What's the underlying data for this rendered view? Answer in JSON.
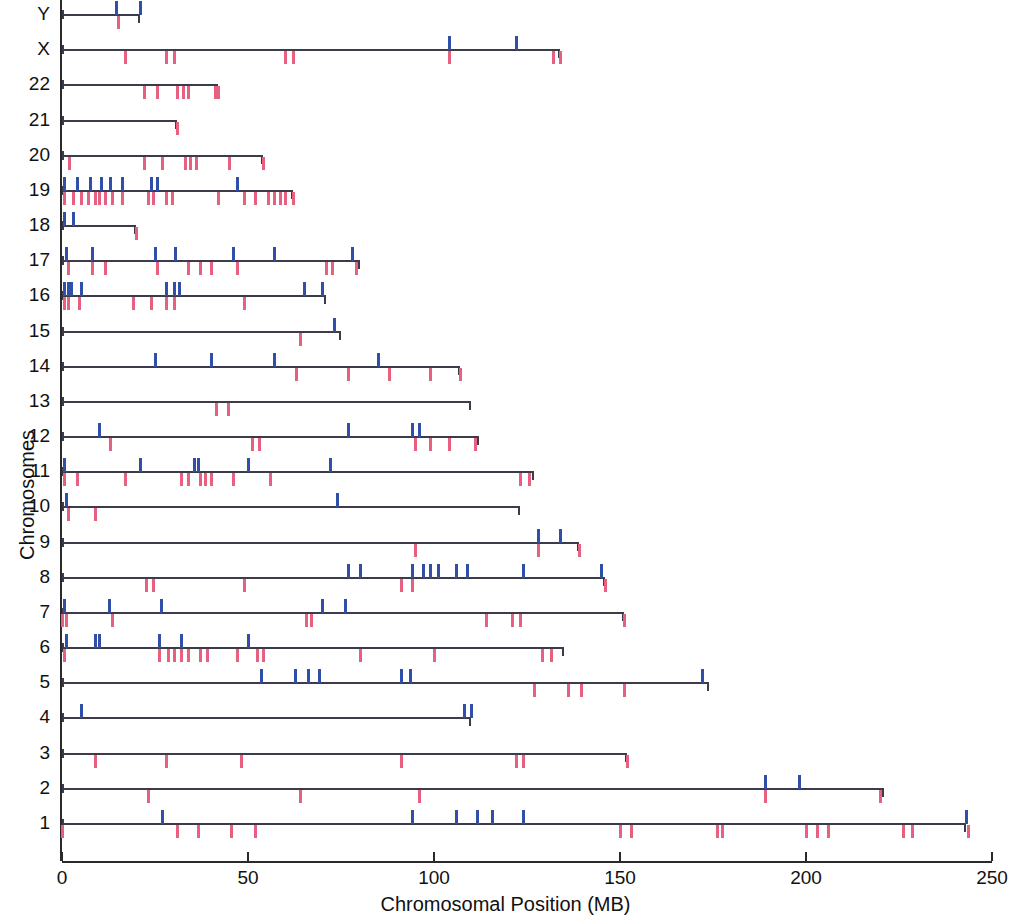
{
  "axes": {
    "x_title": "Chromosomal Position (MB)",
    "y_title": "Chromosomes",
    "x_ticks": [
      "0",
      "50",
      "100",
      "150",
      "200",
      "250"
    ],
    "x_min": 0,
    "x_max": 250
  },
  "colors": {
    "blue": "#2f4fa8",
    "red": "#e8607f",
    "line": "#3b3b4a",
    "axis": "#2a2a2a"
  },
  "chart_data": {
    "type": "scatter",
    "title": "",
    "xlabel": "Chromosomal Position (MB)",
    "ylabel": "Chromosomes",
    "xlim": [
      0,
      250
    ],
    "grid": false,
    "legend": null,
    "categories": [
      "1",
      "2",
      "3",
      "4",
      "5",
      "6",
      "7",
      "8",
      "9",
      "10",
      "11",
      "12",
      "13",
      "14",
      "15",
      "16",
      "17",
      "18",
      "19",
      "20",
      "21",
      "22",
      "X",
      "Y"
    ],
    "chromosomes": [
      {
        "name": "Y",
        "length": 21,
        "blue": [
          14.5,
          21.0
        ],
        "red": [
          15.0
        ]
      },
      {
        "name": "X",
        "length": 134,
        "blue": [
          104.0,
          122.0
        ],
        "red": [
          17.0,
          28.0,
          30.0,
          60.0,
          62.0,
          104.0,
          132.0,
          134.0
        ]
      },
      {
        "name": "22",
        "length": 42,
        "blue": [],
        "red": [
          22.0,
          25.5,
          31.0,
          32.5,
          34.0,
          41.0,
          42.0
        ]
      },
      {
        "name": "21",
        "length": 31,
        "blue": [],
        "red": [
          31.0
        ]
      },
      {
        "name": "20",
        "length": 54,
        "blue": [],
        "red": [
          2.0,
          22.0,
          27.0,
          33.0,
          34.5,
          36.0,
          45.0,
          54.0
        ]
      },
      {
        "name": "19",
        "length": 62,
        "blue": [
          0.5,
          4.0,
          7.5,
          10.5,
          13.0,
          16.0,
          24.0,
          25.5,
          47.0
        ],
        "red": [
          0.5,
          3.0,
          5.0,
          7.0,
          9.0,
          10.0,
          11.5,
          13.5,
          16.0,
          23.0,
          24.5,
          28.0,
          29.5,
          42.0,
          49.0,
          52.0,
          55.5,
          57.0,
          58.5,
          60.0,
          62.0
        ]
      },
      {
        "name": "18",
        "length": 20,
        "blue": [
          0.5,
          3.0
        ],
        "red": [
          20.0
        ]
      },
      {
        "name": "17",
        "length": 80,
        "blue": [
          1.0,
          8.0,
          25.0,
          30.5,
          46.0,
          57.0,
          78.0
        ],
        "red": [
          1.5,
          8.0,
          11.5,
          25.5,
          34.0,
          37.0,
          40.0,
          47.0,
          71.0,
          72.5,
          79.0
        ]
      },
      {
        "name": "16",
        "length": 71,
        "blue": [
          0.5,
          1.5,
          2.5,
          5.0,
          28.0,
          30.0,
          31.5,
          65.0,
          70.0
        ],
        "red": [
          0.5,
          1.5,
          4.5,
          19.0,
          24.0,
          28.0,
          30.0,
          49.0
        ]
      },
      {
        "name": "15",
        "length": 75,
        "blue": [
          73.0
        ],
        "red": [
          64.0
        ]
      },
      {
        "name": "14",
        "length": 107,
        "blue": [
          25.0,
          40.0,
          57.0,
          85.0
        ],
        "red": [
          63.0,
          77.0,
          88.0,
          99.0,
          107.0
        ]
      },
      {
        "name": "13",
        "length": 110,
        "blue": [],
        "red": [
          41.5,
          44.5
        ]
      },
      {
        "name": "12",
        "length": 112,
        "blue": [
          10.0,
          77.0,
          94.0,
          96.0
        ],
        "red": [
          13.0,
          51.0,
          53.0,
          95.0,
          99.0,
          104.0,
          111.0
        ]
      },
      {
        "name": "11",
        "length": 127,
        "blue": [
          0.5,
          21.0,
          35.5,
          36.5,
          50.0,
          72.0
        ],
        "red": [
          0.5,
          4.0,
          17.0,
          32.0,
          34.0,
          37.0,
          38.5,
          40.0,
          46.0,
          56.0,
          123.0,
          125.5
        ]
      },
      {
        "name": "10",
        "length": 123,
        "blue": [
          1.0,
          74.0
        ],
        "red": [
          1.5,
          9.0
        ]
      },
      {
        "name": "9",
        "length": 139,
        "blue": [
          128.0,
          134.0
        ],
        "red": [
          95.0,
          128.0,
          139.0
        ]
      },
      {
        "name": "8",
        "length": 146,
        "blue": [
          77.0,
          80.0,
          94.0,
          97.0,
          99.0,
          101.0,
          106.0,
          109.0,
          124.0,
          145.0
        ],
        "red": [
          22.5,
          24.5,
          49.0,
          91.0,
          94.0,
          146.0
        ]
      },
      {
        "name": "7",
        "length": 151,
        "blue": [
          0.5,
          12.5,
          26.5,
          70.0,
          76.0
        ],
        "red": [
          0.0,
          1.0,
          13.5,
          65.5,
          67.0,
          114.0,
          121.0,
          123.0,
          151.0
        ]
      },
      {
        "name": "6",
        "length": 135,
        "blue": [
          1.0,
          9.0,
          10.0,
          26.0,
          32.0,
          50.0
        ],
        "red": [
          0.5,
          26.0,
          28.5,
          30.0,
          32.0,
          34.0,
          37.0,
          39.0,
          47.0,
          52.5,
          54.0,
          80.0,
          100.0,
          129.0,
          131.5
        ]
      },
      {
        "name": "5",
        "length": 174,
        "blue": [
          53.5,
          62.5,
          66.0,
          69.0,
          91.0,
          93.5,
          172.0
        ],
        "red": [
          127.0,
          136.0,
          139.5,
          151.0
        ]
      },
      {
        "name": "4",
        "length": 110,
        "blue": [
          5.0,
          108.0,
          110.0
        ],
        "red": []
      },
      {
        "name": "3",
        "length": 152,
        "blue": [],
        "red": [
          9.0,
          28.0,
          48.0,
          91.0,
          122.0,
          124.0,
          152.0
        ]
      },
      {
        "name": "2",
        "length": 221,
        "blue": [
          189.0,
          198.0
        ],
        "red": [
          23.0,
          64.0,
          96.0,
          189.0,
          220.0
        ]
      },
      {
        "name": "1",
        "length": 243,
        "blue": [
          27.0,
          94.0,
          106.0,
          111.5,
          115.5,
          124.0,
          243.0
        ],
        "red": [
          0.0,
          31.0,
          36.5,
          45.5,
          52.0,
          150.0,
          153.0,
          176.0,
          177.5,
          200.0,
          203.0,
          206.0,
          226.0,
          228.5,
          243.5
        ]
      }
    ]
  }
}
